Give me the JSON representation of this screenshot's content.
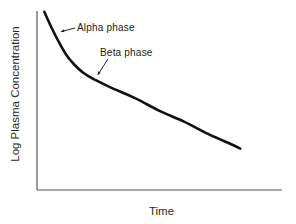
{
  "chart_data": {
    "type": "line",
    "title": "",
    "xlabel": "Time",
    "ylabel": "Log Plasma Concentration",
    "x_ticks": [],
    "y_ticks": [],
    "grid": false,
    "legend": null,
    "xlim": [
      0,
      1
    ],
    "ylim": [
      0,
      1
    ],
    "series": [
      {
        "name": "Log plasma concentration (biexponential decline)",
        "x": [
          0.03,
          0.06,
          0.09,
          0.12,
          0.15,
          0.19,
          0.24,
          0.3,
          0.4,
          0.5,
          0.6,
          0.7,
          0.8,
          0.83
        ],
        "y": [
          0.99,
          0.9,
          0.82,
          0.75,
          0.7,
          0.65,
          0.61,
          0.57,
          0.51,
          0.44,
          0.38,
          0.31,
          0.25,
          0.23
        ]
      }
    ],
    "annotations": [
      {
        "text": "Alpha phase",
        "points_to": {
          "x": 0.09,
          "y": 0.88
        }
      },
      {
        "text": "Beta phase",
        "points_to": {
          "x": 0.24,
          "y": 0.64
        }
      }
    ]
  }
}
